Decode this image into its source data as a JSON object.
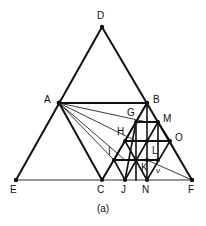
{
  "figure": {
    "caption": "(a)",
    "type": "geometric-construction-diagram",
    "stroke_color": "#111111",
    "thin_stroke_color": "#333333",
    "background_color": "#ffffff",
    "canvas": {
      "width": 206,
      "height": 226
    }
  },
  "points": {
    "D": {
      "label": "D",
      "x": 102,
      "y": 27,
      "label_x": 97,
      "label_y": 11,
      "dot": true
    },
    "A": {
      "label": "A",
      "x": 59,
      "y": 103,
      "label_x": 44,
      "label_y": 95,
      "dot": true
    },
    "B": {
      "label": "B",
      "x": 147,
      "y": 103,
      "label_x": 153,
      "label_y": 95,
      "dot": true
    },
    "E": {
      "label": "E",
      "x": 16,
      "y": 180,
      "label_x": 10,
      "label_y": 185,
      "dot": true
    },
    "C": {
      "label": "C",
      "x": 102,
      "y": 180,
      "label_x": 97,
      "label_y": 185,
      "dot": true
    },
    "J": {
      "label": "J",
      "x": 125,
      "y": 180,
      "label_x": 121,
      "label_y": 185,
      "dot": true
    },
    "N": {
      "label": "N",
      "x": 147,
      "y": 180,
      "label_x": 142,
      "label_y": 185,
      "dot": true
    },
    "F": {
      "label": "F",
      "x": 192,
      "y": 180,
      "label_x": 188,
      "label_y": 185,
      "dot": true
    },
    "G": {
      "label": "G",
      "x": 136,
      "y": 122,
      "label_x": 127,
      "label_y": 108,
      "dot": true
    },
    "M": {
      "label": "M",
      "x": 158,
      "y": 122,
      "label_x": 163,
      "label_y": 114,
      "dot": true
    },
    "H": {
      "label": "H",
      "x": 125,
      "y": 141,
      "label_x": 117,
      "label_y": 127,
      "dot": true
    },
    "O": {
      "label": "O",
      "x": 170,
      "y": 141,
      "label_x": 175,
      "label_y": 133,
      "dot": true
    },
    "I": {
      "label": "I",
      "x": 114,
      "y": 160,
      "label_x": 108,
      "label_y": 147,
      "dot": true
    },
    "L": {
      "label": "L",
      "x": 158,
      "y": 160,
      "label_x": 152,
      "label_y": 148,
      "dot": true
    },
    "K": {
      "label": "K",
      "x": 147,
      "y": 160,
      "label_x": 143,
      "label_y": 164,
      "dot": true
    },
    "v": {
      "label": "v",
      "x": 158,
      "y": 172,
      "label_x": 155,
      "label_y": 165,
      "dot": false
    }
  },
  "segments": {
    "outer_triangle": [
      {
        "name": "D-E",
        "from": "D",
        "to": "E",
        "weight": "thick"
      },
      {
        "name": "D-F",
        "from": "D",
        "to": "F",
        "weight": "thick"
      },
      {
        "name": "E-F",
        "from": "E",
        "to": "F",
        "weight": "thin"
      }
    ],
    "inner_triangle": [
      {
        "name": "A-B",
        "from": "A",
        "to": "B",
        "weight": "thick"
      },
      {
        "name": "A-C",
        "from": "A",
        "to": "C",
        "weight": "thick"
      },
      {
        "name": "B-N",
        "from": "B",
        "to": "N",
        "weight": "thick"
      }
    ],
    "fan_from_A": [
      {
        "name": "A-G",
        "from": "A",
        "to": "G",
        "weight": "thin"
      },
      {
        "name": "A-H",
        "from": "A",
        "to": "H",
        "weight": "thin"
      },
      {
        "name": "A-I",
        "from": "A",
        "to": "I",
        "weight": "thin"
      },
      {
        "name": "A-J",
        "from": "A",
        "to": "J",
        "weight": "thin"
      }
    ],
    "fan_to_F": [
      {
        "name": "K-F",
        "from": "K",
        "to": "F",
        "weight": "thin"
      },
      {
        "name": "O-F",
        "from": "O",
        "to": "F",
        "weight": "thick"
      }
    ],
    "lattice_horizontals": [
      {
        "name": "G-M",
        "x1": 136,
        "y1": 122,
        "x2": 158,
        "y2": 122
      },
      {
        "name": "H-O",
        "x1": 125,
        "y1": 141,
        "x2": 170,
        "y2": 141
      },
      {
        "name": "I-L",
        "x1": 114,
        "y1": 160,
        "x2": 158,
        "y2": 160
      }
    ],
    "lattice_down_right": [
      {
        "name": "B-N",
        "x1": 147,
        "y1": 103,
        "x2": 147,
        "y2": 180
      },
      {
        "name": "G-J",
        "x1": 136,
        "y1": 122,
        "x2": 125,
        "y2": 180
      },
      {
        "name": "H-C",
        "x1": 125,
        "y1": 141,
        "x2": 102,
        "y2": 180
      },
      {
        "name": "M-F-edge",
        "x1": 158,
        "y1": 122,
        "x2": 170,
        "y2": 141
      }
    ],
    "lattice_down_left": [
      {
        "name": "B-C",
        "x1": 147,
        "y1": 103,
        "x2": 102,
        "y2": 180
      },
      {
        "name": "M-N",
        "x1": 158,
        "y1": 122,
        "x2": 125,
        "y2": 180
      },
      {
        "name": "O-F",
        "x1": 170,
        "y1": 141,
        "x2": 147,
        "y2": 180
      }
    ]
  },
  "labels_order": [
    "D",
    "A",
    "B",
    "G",
    "M",
    "H",
    "O",
    "I",
    "L",
    "K",
    "v",
    "E",
    "C",
    "J",
    "N",
    "F"
  ]
}
